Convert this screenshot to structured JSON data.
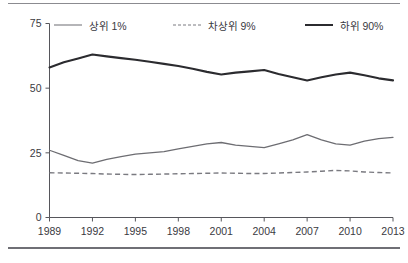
{
  "chart_data": {
    "type": "line",
    "title": "",
    "subtitle": "",
    "xlabel": "",
    "ylabel": "",
    "ylim": [
      0,
      75
    ],
    "yticks": [
      0,
      25,
      50,
      75
    ],
    "xlim": [
      1989,
      2013
    ],
    "xticks": [
      1989,
      1992,
      1995,
      1998,
      2001,
      2004,
      2007,
      2010,
      2013
    ],
    "xtick_labels": [
      "1989",
      "1992",
      "1995",
      "1998",
      "2001",
      "2004",
      "2007",
      "2010",
      "2013"
    ],
    "ytick_labels": [
      "0",
      "25",
      "50",
      "75"
    ],
    "grid": false,
    "legend_position": "top",
    "x": [
      1989,
      1990,
      1991,
      1992,
      1993,
      1994,
      1995,
      1996,
      1997,
      1998,
      1999,
      2000,
      2001,
      2002,
      2003,
      2004,
      2005,
      2006,
      2007,
      2008,
      2009,
      2010,
      2011,
      2012,
      2013
    ],
    "series": [
      {
        "name": "상위 1%",
        "style": "solid",
        "color": "#6d6d72",
        "width": 1.3,
        "values": [
          26.0,
          24.0,
          22.0,
          21.0,
          22.5,
          23.5,
          24.5,
          25.0,
          25.5,
          26.5,
          27.5,
          28.5,
          29.0,
          28.0,
          27.5,
          27.0,
          28.5,
          30.0,
          32.0,
          30.0,
          28.5,
          28.0,
          29.5,
          30.5,
          31.0
        ]
      },
      {
        "name": "차상위 9%",
        "style": "dashed",
        "color": "#7a7a80",
        "width": 1.4,
        "values": [
          17.3,
          17.2,
          17.1,
          17.0,
          16.8,
          16.7,
          16.6,
          16.7,
          16.8,
          16.9,
          17.0,
          17.1,
          17.2,
          17.1,
          17.0,
          17.0,
          17.2,
          17.4,
          17.6,
          17.9,
          18.2,
          18.0,
          17.6,
          17.4,
          17.2
        ]
      },
      {
        "name": "하위 90%",
        "style": "solid",
        "color": "#2b2b2f",
        "width": 2.1,
        "values": [
          58.0,
          60.0,
          61.5,
          63.0,
          62.3,
          61.6,
          61.0,
          60.2,
          59.4,
          58.6,
          57.5,
          56.3,
          55.3,
          56.0,
          56.5,
          57.0,
          55.5,
          54.2,
          53.0,
          54.2,
          55.3,
          56.0,
          55.0,
          53.8,
          53.0
        ]
      }
    ]
  },
  "legend": {
    "items": [
      {
        "label": "상위 1%",
        "swatch": "solid-gray-line-icon"
      },
      {
        "label": "차상위 9%",
        "swatch": "dashed-gray-line-icon"
      },
      {
        "label": "하위 90%",
        "swatch": "solid-black-line-icon"
      }
    ]
  },
  "colors": {
    "top1": "#6d6d72",
    "next9": "#7a7a80",
    "bottom90": "#2b2b2f",
    "axis": "#56565b",
    "text": "#3a3a3f",
    "rule": "#8b8b90",
    "background": "#ffffff"
  }
}
